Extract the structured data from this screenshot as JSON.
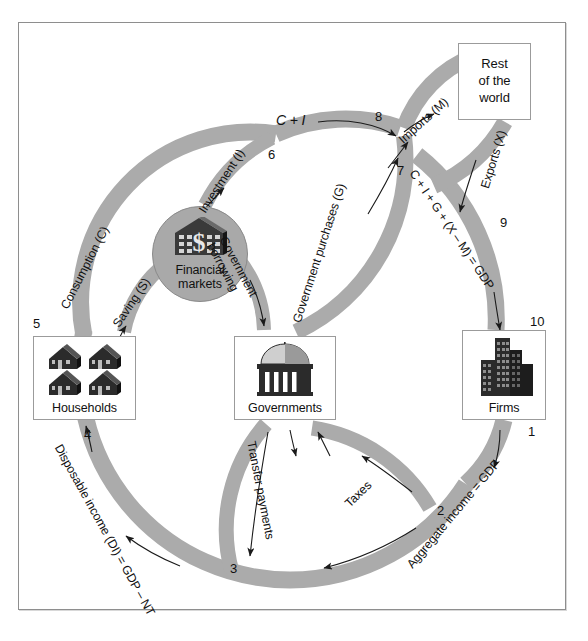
{
  "diagram": {
    "band_color": "#ababab",
    "frame_color": "#8e8e8e"
  },
  "nodes": {
    "rest_of_world": {
      "label": "Rest\nof the\nworld",
      "line1": "Rest",
      "line2": "of the",
      "line3": "world"
    },
    "households": {
      "label": "Households",
      "icon": "houses-icon"
    },
    "governments": {
      "label": "Governments",
      "icon": "capitol-dome-icon"
    },
    "firms": {
      "label": "Firms",
      "icon": "office-buildings-icon"
    },
    "financial_markets": {
      "line1": "Financial",
      "line2": "markets",
      "icon": "bank-dollar-icon"
    }
  },
  "flows": [
    {
      "id": "consumption",
      "label": "Consumption (C)"
    },
    {
      "id": "saving",
      "label": "Saving (S)"
    },
    {
      "id": "investment",
      "label": "Investment (I)"
    },
    {
      "id": "c-plus-i",
      "label": "C + I"
    },
    {
      "id": "government-borrowing",
      "label": "Government\nborrowing",
      "line1": "Government",
      "line2": "borrowing"
    },
    {
      "id": "government-purchases",
      "label": "Government purchases (G)"
    },
    {
      "id": "imports",
      "label": "Imports (M)"
    },
    {
      "id": "exports",
      "label": "Exports (X)"
    },
    {
      "id": "gdp-expenditure",
      "label": "C + I + G + (X – M) = GDP"
    },
    {
      "id": "aggregate-income",
      "label": "Aggregate income = GDP"
    },
    {
      "id": "taxes",
      "label": "Taxes"
    },
    {
      "id": "transfer-payments",
      "label": "Transfer payments"
    },
    {
      "id": "disposable-income",
      "label": "Disposable income (DI) = GDP – NT"
    }
  ],
  "step_numbers": {
    "one": "1",
    "two": "2",
    "three": "3",
    "four": "4",
    "five": "5",
    "six": "6",
    "seven": "7",
    "eight": "8",
    "nine": "9",
    "ten": "10"
  }
}
